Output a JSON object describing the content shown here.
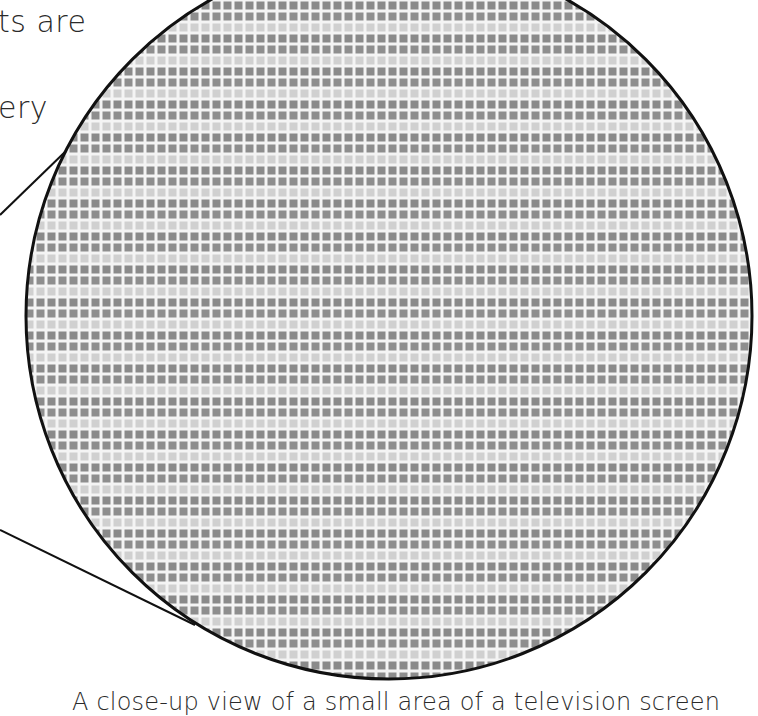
{
  "text_fragments": {
    "line1": "ts are",
    "line2": "ery"
  },
  "figure": {
    "name": "tv-screen-closeup",
    "circle": {
      "cx": 389,
      "cy": 316,
      "r": 363
    },
    "grid": {
      "pitch": 11,
      "cell": 8,
      "row_pattern": [
        "dark",
        "dark",
        "light"
      ]
    },
    "colors": {
      "dark_cell": "#8a8a8a",
      "light_cell": "#cfcfcf",
      "gap": "#f4f4f4",
      "outline": "#111111"
    },
    "pointer_lines": [
      {
        "x1": 0,
        "y1": 215,
        "x2": 100,
        "y2": 118
      },
      {
        "x1": 0,
        "y1": 530,
        "x2": 195,
        "y2": 625
      }
    ]
  },
  "caption": "A close-up view of a small area of a television screen"
}
